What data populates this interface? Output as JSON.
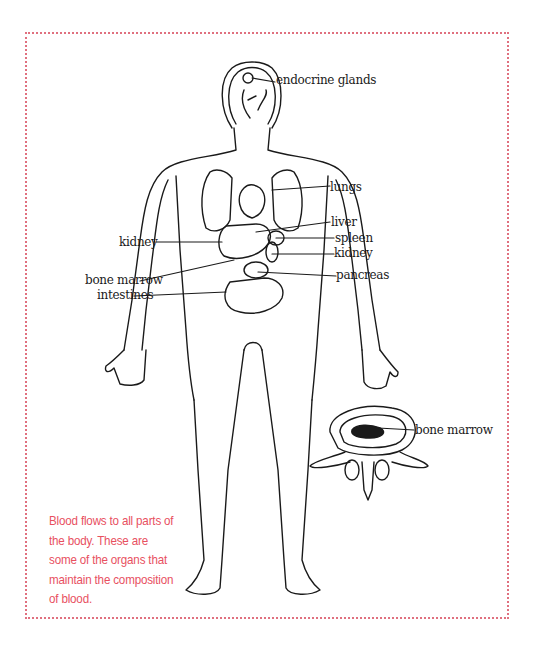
{
  "diagram": {
    "frame_color": "#e0707f",
    "caption_color": "#e8505f",
    "labels": {
      "endocrine_glands": "endocrine glands",
      "lungs": "lungs",
      "liver": "liver",
      "spleen": "spleen",
      "kidney_right": "kidney",
      "kidney_left": "kidney",
      "pancreas": "pancreas",
      "bone_marrow_body": "bone marrow",
      "intestines": "intestines",
      "bone_marrow_vertebra": "bone marrow"
    },
    "caption": "Blood flows to all parts of the body.  These are some of the organs that maintain the composition of blood."
  }
}
